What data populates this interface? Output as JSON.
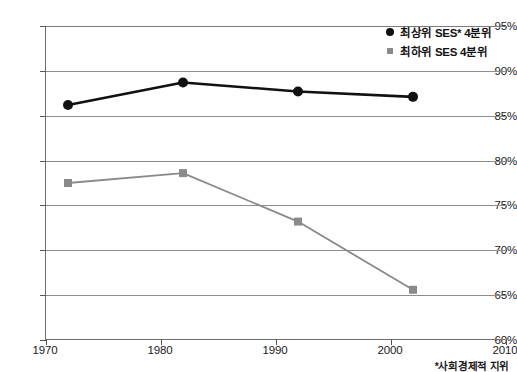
{
  "chart_data": {
    "type": "line",
    "title": "",
    "xlabel": "",
    "ylabel": "",
    "x": [
      1972,
      1982,
      1992,
      2002
    ],
    "xlim": [
      1970,
      2010
    ],
    "ylim": [
      60,
      95
    ],
    "grid": true,
    "legend_position": "top-right",
    "x_ticks": [
      "1970",
      "1980",
      "1990",
      "2000",
      "2010"
    ],
    "x_tick_values": [
      1970,
      1980,
      1990,
      2000,
      2010
    ],
    "y_ticks": [
      "60%",
      "65%",
      "70%",
      "75%",
      "80%",
      "85%",
      "90%",
      "95%"
    ],
    "y_tick_values": [
      60,
      65,
      70,
      75,
      80,
      85,
      90,
      95
    ],
    "series": [
      {
        "name": "최상위 SES* 4분위",
        "marker": "circle",
        "color": "#111111",
        "values": [
          86.2,
          88.7,
          87.7,
          87.1
        ]
      },
      {
        "name": "최하위 SES 4분위",
        "marker": "square",
        "color": "#8a8a8a",
        "values": [
          77.5,
          78.6,
          73.2,
          65.6
        ]
      }
    ],
    "annotations": [
      "*사회경제적 지위"
    ]
  },
  "legend": {
    "items": [
      {
        "label": "최상위 SES* 4분위",
        "marker": "circle-marker",
        "color": "#111111"
      },
      {
        "label": "최하위 SES 4분위",
        "marker": "square-marker",
        "color": "#8a8a8a"
      }
    ]
  },
  "footnote": {
    "text": "*사회경제적 지위"
  },
  "colors": {
    "series_high": "#111111",
    "series_low": "#8a8a8a",
    "grid": "#8e8e8e",
    "axis": "#6f6f6f",
    "text": "#1a1a1a",
    "background": "#ffffff"
  }
}
